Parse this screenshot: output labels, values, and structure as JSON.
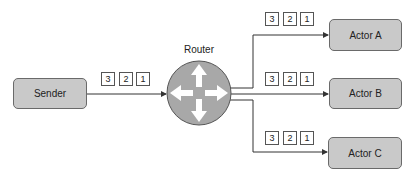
{
  "diagram": {
    "router": {
      "label": "Router",
      "icon": "four-way-arrows-icon",
      "fill": "#a8a8a8"
    },
    "sender": {
      "label": "Sender"
    },
    "actors": [
      {
        "label": "Actor A"
      },
      {
        "label": "Actor B"
      },
      {
        "label": "Actor C"
      }
    ],
    "packet_groups": {
      "sender_to_router": [
        "3",
        "2",
        "1"
      ],
      "to_actor_a": [
        "3",
        "2",
        "1"
      ],
      "to_actor_b": [
        "3",
        "2",
        "1"
      ],
      "to_actor_c": [
        "3",
        "2",
        "1"
      ]
    },
    "colors": {
      "box_fill": "#c9c9c9",
      "box_border": "#6a6a6a",
      "line": "#333333"
    }
  }
}
